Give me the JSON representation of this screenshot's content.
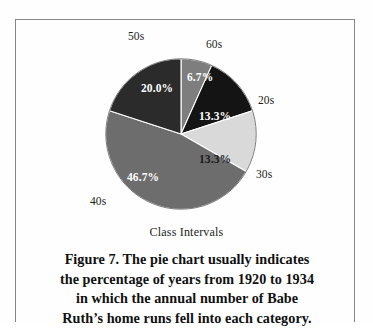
{
  "figure": {
    "frame_color": "#868686",
    "background": "#fefefe",
    "axis_caption": "Class Intervals",
    "caption_lines": [
      "Figure 7.  The pie chart usually indicates",
      "the percentage of years from 1920 to 1934",
      "in which the annual number of Babe",
      "Ruth’s home runs fell into each category."
    ]
  },
  "chart_data": {
    "type": "pie",
    "title": "",
    "xlabel": "Class Intervals",
    "ylabel": "",
    "legend_position": "none",
    "grid": false,
    "start_angle_deg": 0,
    "direction": "clockwise",
    "categories": [
      "60s",
      "20s",
      "30s",
      "40s",
      "50s"
    ],
    "values": [
      6.7,
      13.3,
      13.3,
      46.7,
      20.0
    ],
    "value_unit": "percent",
    "slices": [
      {
        "label": "60s",
        "value": 6.7,
        "display_value": "6.7%",
        "color": "#7e7e7e",
        "label_text_color": "#ffffff",
        "start_deg": 0.0,
        "end_deg": 24.12
      },
      {
        "label": "20s",
        "value": 13.3,
        "display_value": "13.3%",
        "color": "#141414",
        "label_text_color": "#ffffff",
        "start_deg": 24.12,
        "end_deg": 72.0
      },
      {
        "label": "30s",
        "value": 13.3,
        "display_value": "13.3%",
        "color": "#d9d9d9",
        "label_text_color": "#1b1b1b",
        "start_deg": 72.0,
        "end_deg": 119.88
      },
      {
        "label": "40s",
        "value": 46.7,
        "display_value": "46.7%",
        "color": "#6d6d6d",
        "label_text_color": "#ffffff",
        "start_deg": 119.88,
        "end_deg": 288.0
      },
      {
        "label": "50s",
        "value": 20.0,
        "display_value": "20.0%",
        "color": "#2b2b2b",
        "label_text_color": "#ffffff",
        "start_deg": 288.0,
        "end_deg": 360.0
      }
    ]
  },
  "labels": {
    "cat_50s": "50s",
    "cat_60s": "60s",
    "cat_20s": "20s",
    "cat_30s": "30s",
    "cat_40s": "40s",
    "pct_60s": "6.7%",
    "pct_20s": "13.3%",
    "pct_30s": "13.3%",
    "pct_40s": "46.7%",
    "pct_50s": "20.0%"
  }
}
